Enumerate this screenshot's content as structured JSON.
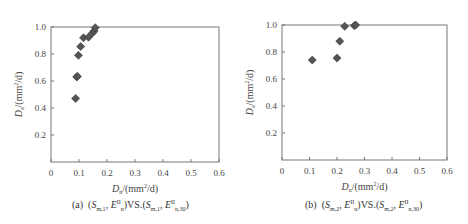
{
  "chart_data": [
    {
      "type": "scatter",
      "panel_label": "(a)",
      "caption": "(a) (S_m,1, E_n^II) VS. (S_m,1, E_n,30^II)",
      "xlabel": "D_n/(mm²/d)",
      "ylabel": "D_a/(mm²/d)",
      "xlim": [
        0,
        0.6
      ],
      "ylim": [
        0,
        1.0
      ],
      "x_ticks": [
        "0",
        "0.1",
        "0.2",
        "0.3",
        "0.4",
        "0.5",
        "0.6"
      ],
      "y_ticks": [
        "0.2",
        "0.4",
        "0.6",
        "0.8",
        "1.0"
      ],
      "grid": false,
      "marker": "diamond",
      "marker_color": "#555555",
      "points": [
        {
          "x": 0.088,
          "y": 0.47
        },
        {
          "x": 0.092,
          "y": 0.63
        },
        {
          "x": 0.094,
          "y": 0.635
        },
        {
          "x": 0.098,
          "y": 0.79
        },
        {
          "x": 0.106,
          "y": 0.855
        },
        {
          "x": 0.116,
          "y": 0.92
        },
        {
          "x": 0.134,
          "y": 0.925
        },
        {
          "x": 0.148,
          "y": 0.955
        },
        {
          "x": 0.154,
          "y": 0.97
        },
        {
          "x": 0.158,
          "y": 0.995
        }
      ]
    },
    {
      "type": "scatter",
      "panel_label": "(b)",
      "caption": "(b) (S_m,2, E_n^II) VS. (S_m,2, E_n,30^II)",
      "xlabel": "D_n/(mm²/d)",
      "ylabel": "D_a/(mm²/d)",
      "xlim": [
        0,
        0.6
      ],
      "ylim": [
        0,
        1.0
      ],
      "x_ticks": [
        "0",
        "0.1",
        "0.2",
        "0.3",
        "0.4",
        "0.5",
        "0.6"
      ],
      "y_ticks": [
        "0.2",
        "0.4",
        "0.6",
        "0.8",
        "1.0"
      ],
      "grid": false,
      "marker": "diamond",
      "marker_color": "#555555",
      "points": [
        {
          "x": 0.11,
          "y": 0.74
        },
        {
          "x": 0.2,
          "y": 0.755
        },
        {
          "x": 0.21,
          "y": 0.88
        },
        {
          "x": 0.228,
          "y": 0.99
        },
        {
          "x": 0.263,
          "y": 0.995
        },
        {
          "x": 0.268,
          "y": 1.0
        }
      ]
    }
  ],
  "labels": {
    "a": {
      "prefix": "(a)",
      "s": "S",
      "s_sub": "m,1",
      "e": "E",
      "e_sup": "II",
      "e_sub": "n",
      "vs": "VS.",
      "e2_sub": "n,30"
    },
    "b": {
      "prefix": "(b)",
      "s": "S",
      "s_sub": "m,2",
      "e": "E",
      "e_sup": "II",
      "e_sub": "n",
      "vs": "VS.",
      "e2_sub": "n,30"
    },
    "xlabel_main": "D",
    "xlabel_sub": "n",
    "xlabel_unit": "/(mm",
    "xlabel_unit_end": "/d)",
    "ylabel_main": "D",
    "ylabel_sub": "a",
    "sq": "2"
  }
}
